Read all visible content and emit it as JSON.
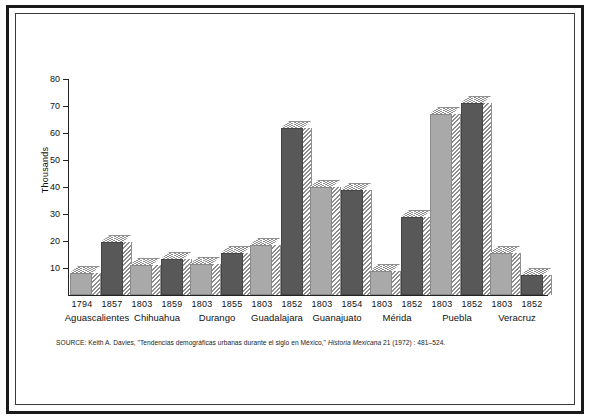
{
  "figure": {
    "y_axis_title": "Thousands",
    "source_prefix": "SOURCE:",
    "source_author": "Keith A. Davies,",
    "source_article": "\"Tendencias demográficas urbanas durante el siglo en México,\"",
    "source_journal": "Historia Mexicana",
    "source_locator": "21 (1972) : 481–524."
  },
  "chart_data": {
    "type": "bar",
    "title": "",
    "xlabel": "",
    "ylabel": "Thousands",
    "ylim": [
      0,
      80
    ],
    "yticks": [
      10,
      20,
      30,
      40,
      50,
      60,
      70,
      80
    ],
    "ytick_labels": [
      "10",
      "20",
      "30",
      "40",
      "50",
      "60",
      "70",
      "80"
    ],
    "grid": false,
    "legend": "none",
    "categories": [
      "Aguascalientes",
      "Chihuahua",
      "Durango",
      "Guadalajara",
      "Guanajuato",
      "Mérida",
      "Puebla",
      "Veracruz"
    ],
    "series": [
      {
        "name": "earlier year",
        "color": "#a9a9a9",
        "years": [
          "1794",
          "1803",
          "1803",
          "1803",
          "1803",
          "1803",
          "1803",
          "1803"
        ],
        "values": [
          8,
          11,
          11.5,
          18.5,
          40,
          9,
          67,
          15.5
        ]
      },
      {
        "name": "later year",
        "color": "#585858",
        "years": [
          "1857",
          "1859",
          "1855",
          "1852",
          "1854",
          "1852",
          "1852",
          "1852"
        ],
        "values": [
          19.5,
          13.5,
          15.5,
          62,
          39,
          29,
          71,
          7.5
        ]
      }
    ]
  }
}
